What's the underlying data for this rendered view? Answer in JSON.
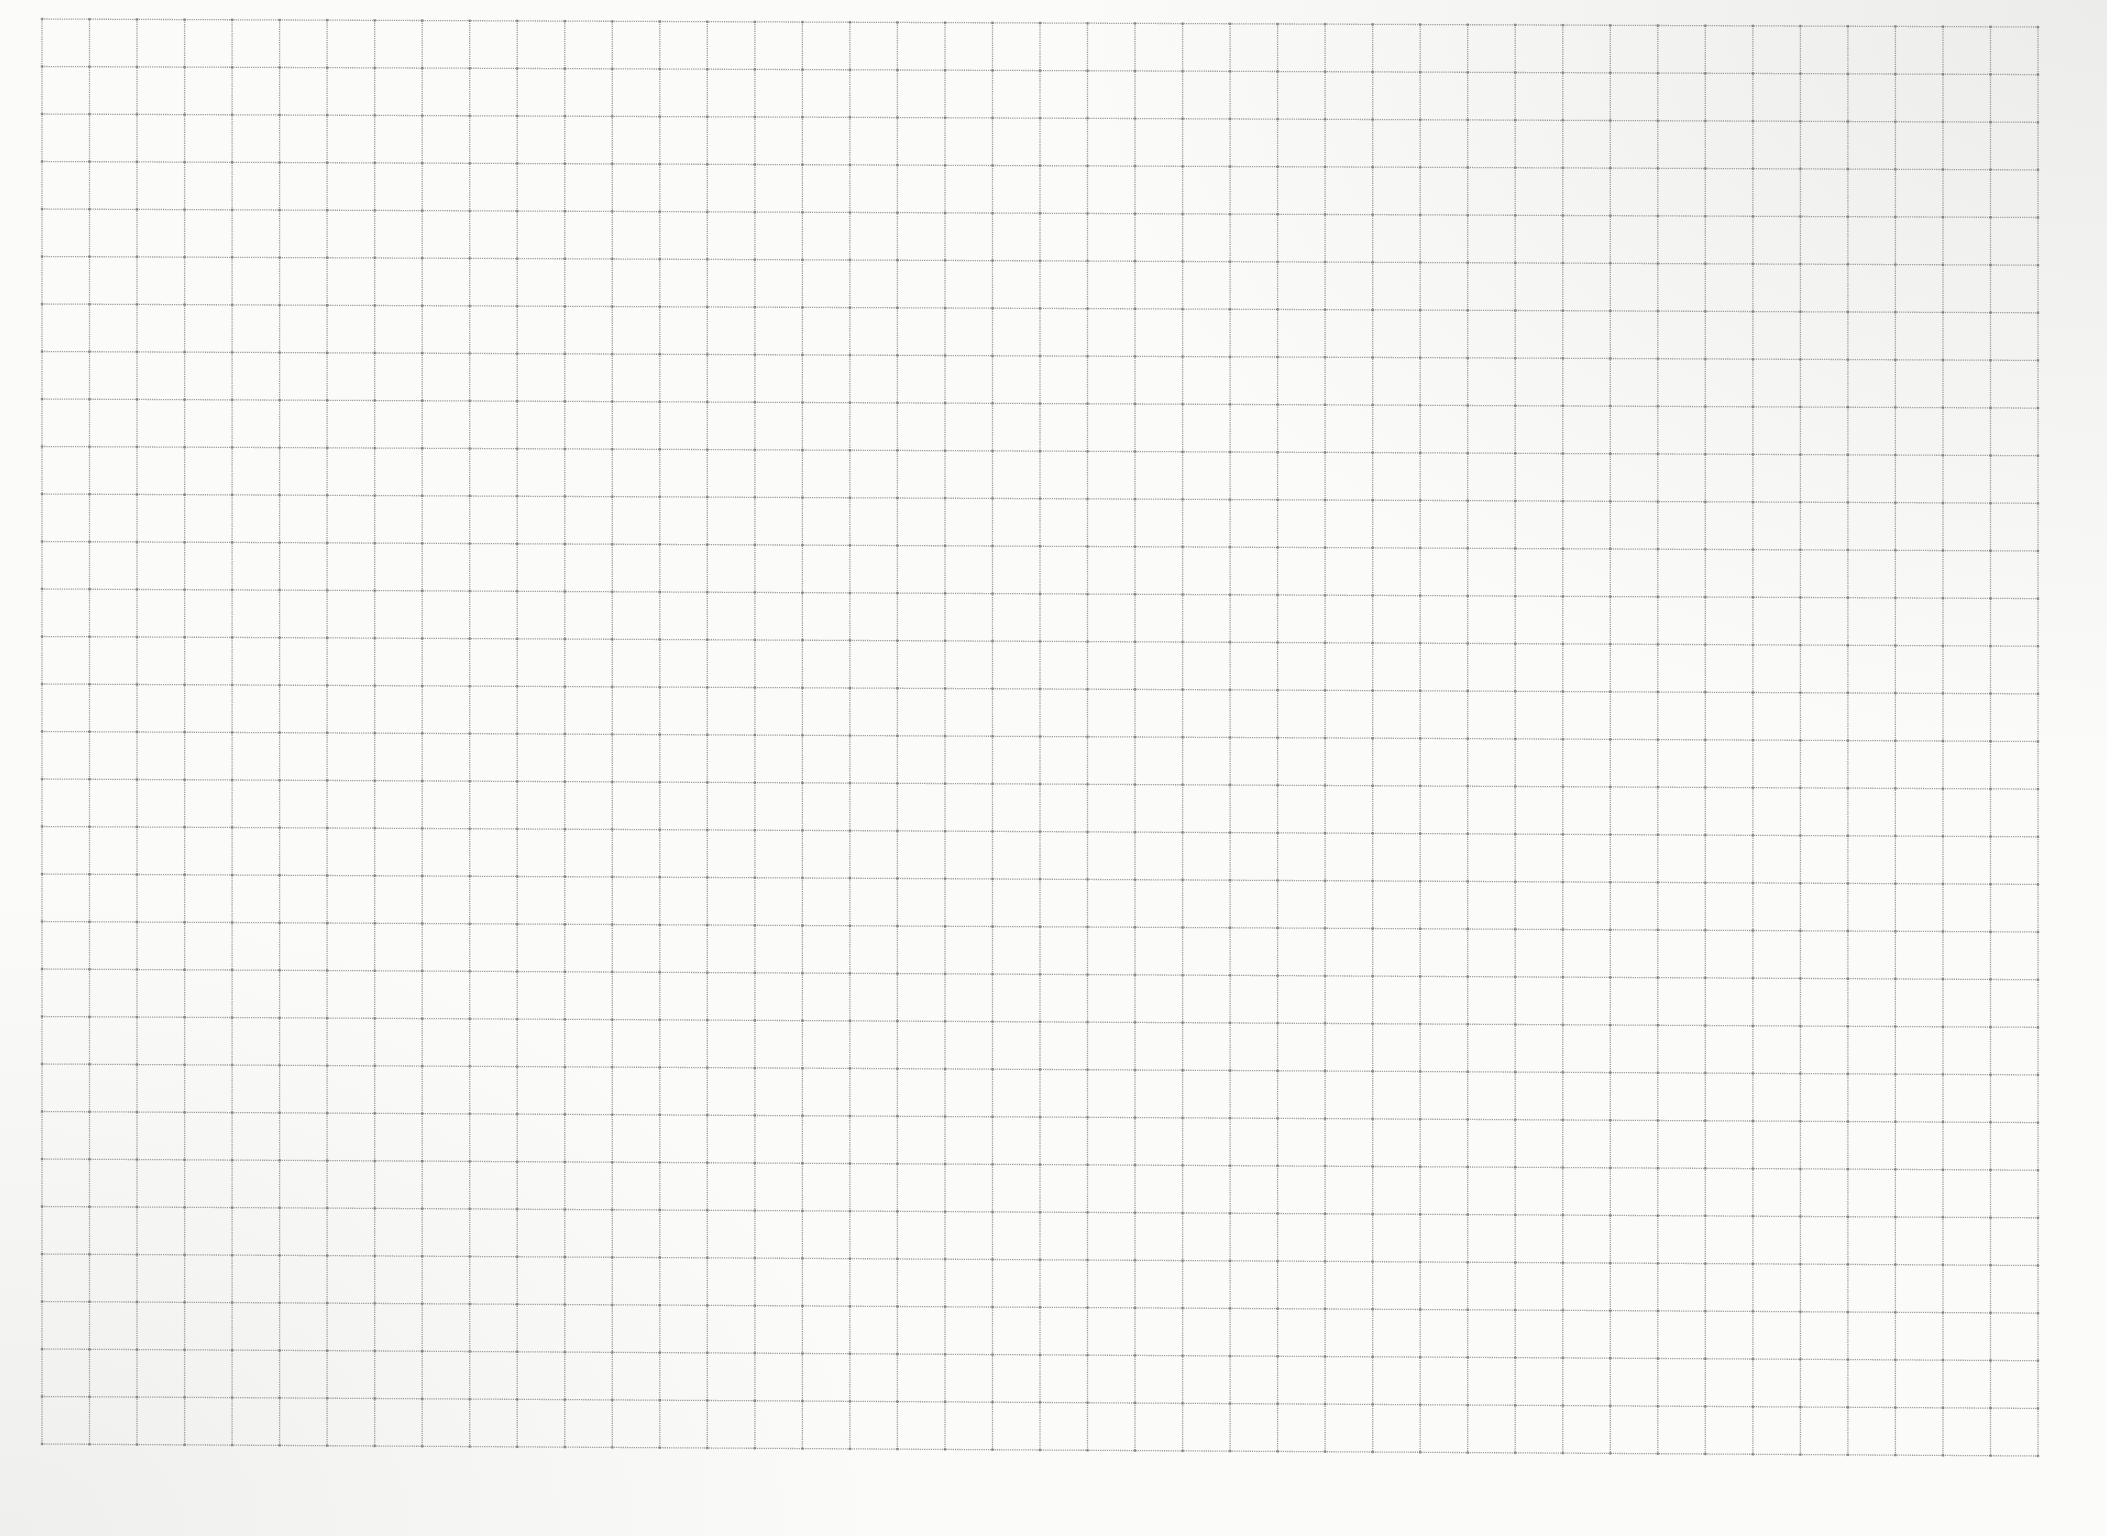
{
  "document": {
    "type": "graph-paper-sheet",
    "background_color": "#fbfbfa",
    "line_color": "#9a9a9a",
    "node_color": "#6f6f6f"
  },
  "grid": {
    "columns": 42,
    "rows": 30,
    "top_left": [
      42,
      19
    ],
    "top_right": [
      2038,
      27
    ],
    "bottom_left": [
      42,
      1444
    ],
    "bottom_right": [
      2038,
      1456
    ],
    "line_style": "dotted",
    "intersection_dots": true
  }
}
